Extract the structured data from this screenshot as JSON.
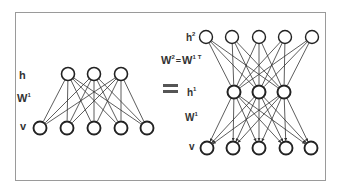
{
  "diagram": {
    "left": {
      "labels": {
        "hidden": "h",
        "weights": "W",
        "weights_sup": "1",
        "visible": "v"
      },
      "layers": {
        "hidden": [
          [
            68,
            74
          ],
          [
            94,
            74
          ],
          [
            121,
            74
          ]
        ],
        "visible": [
          [
            40,
            128
          ],
          [
            67,
            128
          ],
          [
            94,
            128
          ],
          [
            121,
            128
          ],
          [
            147,
            128
          ]
        ]
      }
    },
    "equals": "=",
    "equation": {
      "lhs": "W",
      "lhs_sup": "2",
      "op": "=",
      "rhs": "W",
      "rhs_sup": "1",
      "rhs_transpose": "T"
    },
    "right": {
      "labels": {
        "h2": "h",
        "h2_sup": "2",
        "h1": "h",
        "h1_sup": "1",
        "weights": "W",
        "weights_sup": "1",
        "visible": "v"
      },
      "layers": {
        "h2": [
          [
            206,
            37
          ],
          [
            232,
            37
          ],
          [
            259,
            37
          ],
          [
            285,
            37
          ],
          [
            312,
            37
          ]
        ],
        "h1": [
          [
            234,
            92
          ],
          [
            259,
            92
          ],
          [
            284,
            92
          ]
        ],
        "visible": [
          [
            207,
            148
          ],
          [
            233,
            148
          ],
          [
            259,
            148
          ],
          [
            286,
            148
          ],
          [
            311,
            148
          ]
        ]
      }
    },
    "colors": {
      "node_stroke": "#222222",
      "edge": "#333333",
      "frame": "#9a9a9a",
      "text": "#333333"
    }
  }
}
